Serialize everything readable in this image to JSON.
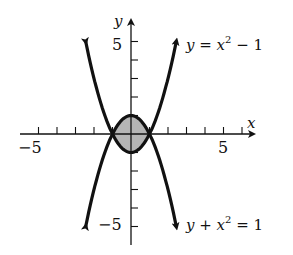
{
  "chart_data": {
    "type": "line",
    "title": "",
    "xlabel": "x",
    "ylabel": "y",
    "xlim": [
      -6,
      6
    ],
    "ylim": [
      -6,
      6
    ],
    "grid": false,
    "x_tick_labels": [
      "-5",
      "5"
    ],
    "y_tick_labels": [
      "5",
      "-5"
    ],
    "series": [
      {
        "name": "y = x^2 - 1",
        "equation": "y = x^2 - 1",
        "x": [
          -2.45,
          -2,
          -1,
          0,
          1,
          2,
          2.45
        ],
        "values": [
          5,
          3,
          0,
          -1,
          0,
          3,
          5
        ]
      },
      {
        "name": "y + x^2 = 1",
        "equation": "y = 1 - x^2",
        "x": [
          -2.45,
          -2,
          -1,
          0,
          1,
          2,
          2.45
        ],
        "values": [
          -5,
          -3,
          0,
          1,
          0,
          -3,
          -5
        ]
      }
    ],
    "shaded_region": {
      "description": "region between curves for -1 <= x <= 1",
      "color": "#b0b0b0"
    },
    "annotations": [
      "y = x² − 1",
      "y + x² = 1"
    ]
  },
  "labels": {
    "x_axis": "x",
    "y_axis": "y",
    "x_min": "−5",
    "x_max": "5",
    "y_max": "5",
    "y_min": "−5",
    "curve1_y": "y = x",
    "curve1_sup": "2",
    "curve1_tail": " − 1",
    "curve2_y": "y + x",
    "curve2_sup": "2",
    "curve2_tail": " = 1"
  }
}
